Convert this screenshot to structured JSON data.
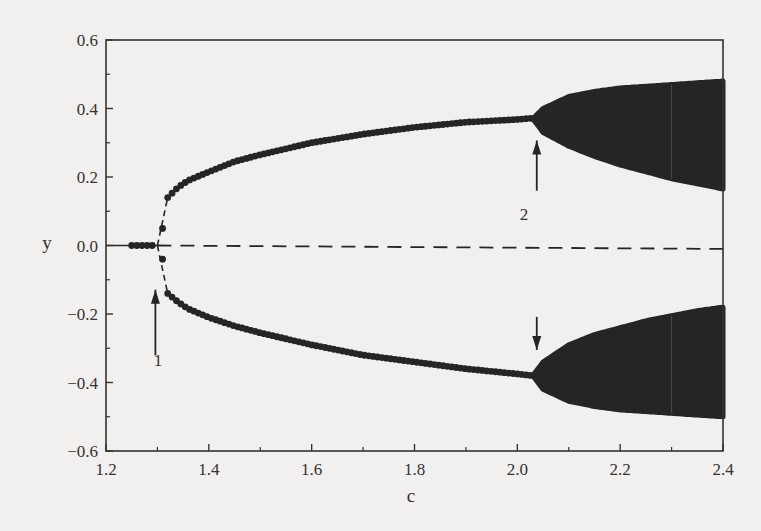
{
  "chart_data": {
    "type": "scatter",
    "title": "",
    "xlabel": "c",
    "ylabel": "y",
    "xlim": [
      1.2,
      2.4
    ],
    "ylim": [
      -0.6,
      0.6
    ],
    "grid": false,
    "legend": null,
    "x_ticks": [
      "1.2",
      "1.4",
      "1.6",
      "1.8",
      "2.0",
      "2.2",
      "2.4"
    ],
    "y_ticks": [
      "0.6",
      "0.4",
      "0.2",
      "0.0",
      "−0.2",
      "−0.4",
      "−0.6"
    ],
    "series": [
      {
        "name": "stable zero equilibrium",
        "style": "dots",
        "x": [
          1.25,
          1.26,
          1.27,
          1.28,
          1.29
        ],
        "y": [
          0,
          0,
          0,
          0,
          0
        ]
      },
      {
        "name": "unstable zero equilibrium",
        "style": "dashed-line",
        "x": [
          1.3,
          2.4
        ],
        "y": [
          0,
          -0.01
        ]
      },
      {
        "name": "upper periodic branch",
        "style": "dots",
        "x": [
          1.31,
          1.32,
          1.34,
          1.36,
          1.4,
          1.45,
          1.5,
          1.6,
          1.7,
          1.8,
          1.9,
          2.0,
          2.03
        ],
        "y": [
          0.05,
          0.14,
          0.17,
          0.19,
          0.215,
          0.245,
          0.265,
          0.3,
          0.325,
          0.345,
          0.36,
          0.368,
          0.372
        ]
      },
      {
        "name": "lower periodic branch",
        "style": "dots",
        "x": [
          1.31,
          1.32,
          1.34,
          1.36,
          1.4,
          1.45,
          1.5,
          1.6,
          1.7,
          1.8,
          1.9,
          2.0,
          2.03
        ],
        "y": [
          -0.04,
          -0.14,
          -0.165,
          -0.185,
          -0.21,
          -0.235,
          -0.255,
          -0.29,
          -0.32,
          -0.34,
          -0.36,
          -0.375,
          -0.38
        ]
      },
      {
        "name": "upper chaotic band",
        "style": "filled-band",
        "x": [
          2.03,
          2.05,
          2.1,
          2.15,
          2.2,
          2.25,
          2.3,
          2.35,
          2.4
        ],
        "y_min": [
          0.37,
          0.33,
          0.29,
          0.26,
          0.235,
          0.215,
          0.195,
          0.18,
          0.165
        ],
        "y_max": [
          0.37,
          0.4,
          0.435,
          0.45,
          0.46,
          0.465,
          0.47,
          0.475,
          0.48
        ]
      },
      {
        "name": "lower chaotic band",
        "style": "filled-band",
        "x": [
          2.03,
          2.05,
          2.1,
          2.15,
          2.2,
          2.25,
          2.3,
          2.35,
          2.4
        ],
        "y_min": [
          -0.38,
          -0.42,
          -0.455,
          -0.47,
          -0.48,
          -0.485,
          -0.49,
          -0.495,
          -0.5
        ],
        "y_max": [
          -0.38,
          -0.34,
          -0.29,
          -0.26,
          -0.24,
          -0.22,
          -0.205,
          -0.19,
          -0.18
        ]
      }
    ],
    "annotations": [
      {
        "text": "1",
        "x": 1.3,
        "y": -0.24,
        "arrow_to": [
          1.3,
          -0.05
        ],
        "arrow_from": [
          1.3,
          -0.21
        ]
      },
      {
        "text": "2",
        "x": 2.03,
        "y": 0.1,
        "arrow_up_to": [
          2.03,
          0.33
        ],
        "arrow_down_to": [
          2.03,
          -0.34
        ],
        "arrow_from_upper": [
          2.03,
          0.16
        ],
        "arrow_from_lower": [
          2.03,
          -0.15
        ]
      }
    ]
  },
  "labels": {
    "xlabel": "c",
    "ylabel": "y",
    "annotation1": "1",
    "annotation2": "2"
  },
  "colors": {
    "ink": "#252525",
    "background": "#f1f0ee",
    "axis": "#333333"
  }
}
